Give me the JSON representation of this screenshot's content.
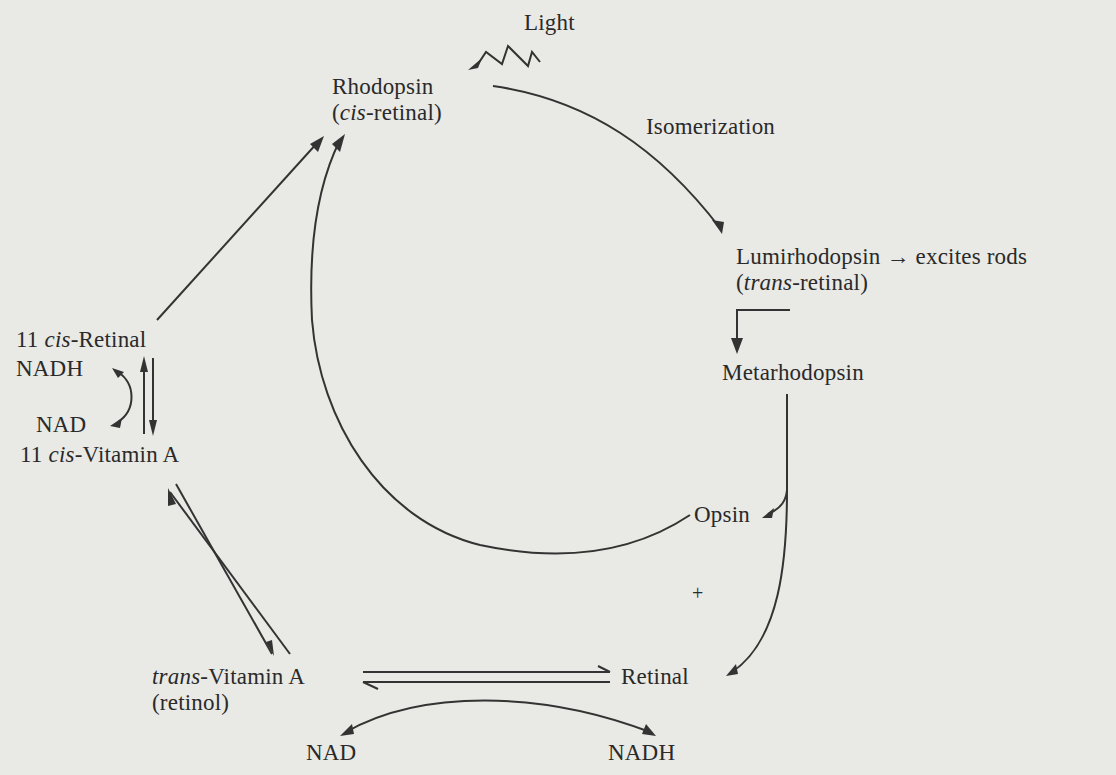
{
  "nodes": {
    "light": {
      "text": "Light"
    },
    "rhodopsin": {
      "line1": "Rhodopsin",
      "line2_open": "(",
      "line2_italic": "cis",
      "line2_rest": "-retinal)"
    },
    "isomerization": {
      "text": "Isomerization"
    },
    "lumirhodopsin": {
      "line1": "Lumirhodopsin → excites rods",
      "line2_open": "(",
      "line2_italic": "trans",
      "line2_rest": "-retinal)"
    },
    "metarhodopsin": {
      "text": "Metarhodopsin"
    },
    "opsin": {
      "text": "Opsin"
    },
    "plus": {
      "text": "+"
    },
    "retinal": {
      "text": "Retinal"
    },
    "cis_retinal": {
      "prefix": "11 ",
      "italic": "cis",
      "rest": "-Retinal"
    },
    "nadh_left": {
      "text": "NADH"
    },
    "nad_left": {
      "text": "NAD"
    },
    "cis_vitamin_a": {
      "prefix": "11 ",
      "italic": "cis",
      "rest": "-Vitamin A"
    },
    "trans_vitamin_a": {
      "italic": "trans",
      "rest": "-Vitamin A",
      "line2": "(retinol)"
    },
    "nad_bottom": {
      "text": "NAD"
    },
    "nadh_bottom": {
      "text": "NADH"
    }
  },
  "edges": [
    {
      "from": "light",
      "to": "rhodopsin",
      "style": "zigzag"
    },
    {
      "from": "rhodopsin",
      "to": "lumirhodopsin",
      "label": "Isomerization"
    },
    {
      "from": "lumirhodopsin",
      "to": "metarhodopsin"
    },
    {
      "from": "metarhodopsin",
      "to": "opsin"
    },
    {
      "from": "metarhodopsin",
      "to": "retinal"
    },
    {
      "from": "opsin",
      "to": "rhodopsin"
    },
    {
      "from": "cis_retinal",
      "to": "rhodopsin"
    },
    {
      "from": "cis_retinal",
      "to": "cis_vitamin_a",
      "style": "reversible"
    },
    {
      "from": "nadh_left",
      "to": "nad_left",
      "style": "cofactor"
    },
    {
      "from": "cis_vitamin_a",
      "to": "trans_vitamin_a",
      "style": "reversible"
    },
    {
      "from": "trans_vitamin_a",
      "to": "retinal",
      "style": "reversible"
    },
    {
      "from": "nad_bottom",
      "to": "nadh_bottom",
      "style": "cofactor"
    }
  ]
}
